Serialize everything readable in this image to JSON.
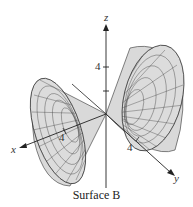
{
  "figure": {
    "caption": "Surface B",
    "surface_type": "double cone along y-axis",
    "axes": {
      "x": {
        "label": "x",
        "tick_label": "4"
      },
      "y": {
        "label": "y",
        "tick_label": "4"
      },
      "z": {
        "label": "z",
        "tick_label": "4"
      }
    },
    "colors": {
      "surface_fill": "#d8d8d8",
      "mesh": "#3a3a3a",
      "axis": "#222222",
      "background": "#ffffff"
    }
  }
}
